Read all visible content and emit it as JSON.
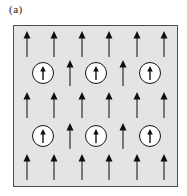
{
  "figure": {
    "label": "(a)"
  },
  "colors": {
    "page_bg": "#ffffff",
    "box_fill": "#e4e4e4",
    "box_border": "#4d4d4d",
    "arrow_head": "#0f0f0f",
    "arrow_stem": "#3d3d3d",
    "circle_fill": "#ffffff",
    "circle_border": "#141414"
  },
  "diagram": {
    "box": {
      "x": 13,
      "y": 25,
      "width": 165,
      "height": 162
    },
    "rows": [
      {
        "y": 18,
        "items": [
          {
            "t": "arrow",
            "x": 13
          },
          {
            "t": "arrow",
            "x": 40
          },
          {
            "t": "arrow",
            "x": 68
          },
          {
            "t": "arrow",
            "x": 95
          },
          {
            "t": "arrow",
            "x": 123
          },
          {
            "t": "arrow",
            "x": 150
          }
        ]
      },
      {
        "y": 47,
        "items": [
          {
            "t": "circled",
            "x": 29
          },
          {
            "t": "arrow",
            "x": 56
          },
          {
            "t": "circled",
            "x": 82
          },
          {
            "t": "arrow",
            "x": 109
          },
          {
            "t": "circled",
            "x": 136
          }
        ]
      },
      {
        "y": 79,
        "items": [
          {
            "t": "arrow",
            "x": 13
          },
          {
            "t": "arrow",
            "x": 40
          },
          {
            "t": "arrow",
            "x": 68
          },
          {
            "t": "arrow",
            "x": 95
          },
          {
            "t": "arrow",
            "x": 123
          },
          {
            "t": "arrow",
            "x": 150
          }
        ]
      },
      {
        "y": 110,
        "items": [
          {
            "t": "circled",
            "x": 29
          },
          {
            "t": "arrow",
            "x": 56
          },
          {
            "t": "circled",
            "x": 82
          },
          {
            "t": "arrow",
            "x": 109
          },
          {
            "t": "circled",
            "x": 136
          }
        ]
      },
      {
        "y": 141,
        "items": [
          {
            "t": "arrow",
            "x": 13
          },
          {
            "t": "arrow",
            "x": 40
          },
          {
            "t": "arrow",
            "x": 68
          },
          {
            "t": "arrow",
            "x": 95
          },
          {
            "t": "arrow",
            "x": 123
          },
          {
            "t": "arrow",
            "x": 150
          }
        ]
      }
    ],
    "spin_direction": "up",
    "plain_arrow_count": 22,
    "circled_spin_count": 6
  }
}
